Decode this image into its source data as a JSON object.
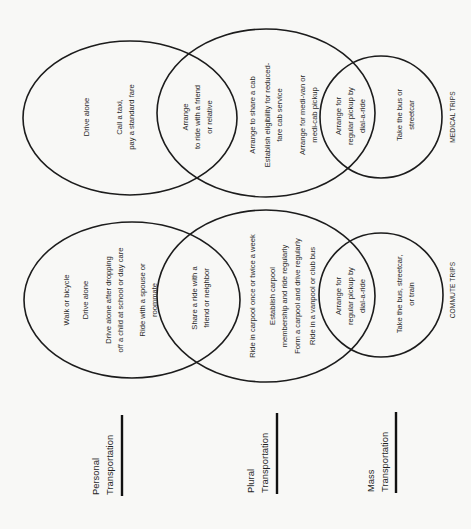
{
  "diagram": {
    "orientation": "rotated 90 degrees counterclockwise (text reads bottom-to-top)",
    "groups": [
      {
        "id": "medical",
        "label": "MEDICAL TRIPS",
        "personal_only": {
          "lines": [
            "Drive alone",
            "Call a taxi,",
            "pay a standard fare"
          ]
        },
        "personal_plural_overlap": {
          "lines": [
            "Arrange",
            "to ride with a friend",
            "or relative"
          ]
        },
        "plural_only": {
          "lines": [
            "Arrange to share a cab",
            "Establish eligibility for reduced-",
            "fare cab service",
            "Arrange for medi-van or",
            "medi-cab pickup"
          ]
        },
        "plural_mass_overlap": {
          "lines": [
            "Arrange for",
            "regular pickup by",
            "dial-a-ride"
          ]
        },
        "mass_only": {
          "lines": [
            "Take the bus or",
            "streetcar"
          ]
        }
      },
      {
        "id": "commute",
        "label": "COMMUTE TRIPS",
        "personal_only": {
          "lines": [
            "Walk or bicycle",
            "Drive alone",
            "Drive alone after dropping",
            "off a child at school or day care",
            "Ride with a spouse or",
            "roommate"
          ]
        },
        "personal_plural_overlap": {
          "lines": [
            "Share a ride with a",
            "friend or neighbor"
          ]
        },
        "plural_only": {
          "lines": [
            "Ride in carpool once or twice a week",
            "Establish carpool",
            "membership and ride regularly",
            "Form a carpool and drive regularly",
            "Ride in a vanpool or club bus"
          ]
        },
        "plural_mass_overlap": {
          "lines": [
            "Arrange for",
            "regular pickup by",
            "dial-a-ride"
          ]
        },
        "mass_only": {
          "lines": [
            "Take the bus, streetcar,",
            "or train"
          ]
        }
      }
    ],
    "legend": [
      {
        "id": "personal",
        "line1": "Personal",
        "line2": "Transportation"
      },
      {
        "id": "plural",
        "line1": "Plural",
        "line2": "Transportation"
      },
      {
        "id": "mass",
        "line1": "Mass",
        "line2": "Transportation"
      }
    ]
  },
  "colors": {
    "background": "#f8f8f6",
    "stroke": "#1c1c1c",
    "text": "#2a2a2a"
  }
}
